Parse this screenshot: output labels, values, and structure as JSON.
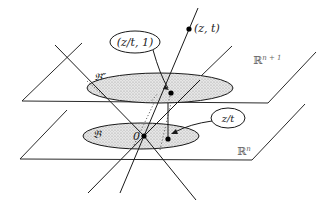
{
  "diagram": {
    "planes": {
      "upper": {
        "label": "ℝ",
        "superscript": "n + 1"
      },
      "lower": {
        "label": "ℝ",
        "superscript": "n"
      }
    },
    "regions": {
      "upper_ball": {
        "label": "𝔅″"
      },
      "lower_ball": {
        "label": "𝔅"
      }
    },
    "points": {
      "origin": {
        "label": "0"
      },
      "zt": {
        "label": "(z, t)"
      },
      "projected_upper": {
        "label": "(z/t, 1)"
      },
      "projected_lower": {
        "label": "z/t"
      }
    },
    "colors": {
      "line": "#1a1a1a",
      "ellipse_fill": "#d9d9d9",
      "label_text": "#222222",
      "plane_label": "#666666"
    }
  }
}
